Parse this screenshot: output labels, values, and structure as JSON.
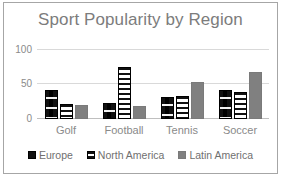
{
  "chart_data": {
    "type": "bar",
    "title": "Sport Popularity by Region",
    "xlabel": "",
    "ylabel": "",
    "categories": [
      "Golf",
      "Football",
      "Tennis",
      "Soccer"
    ],
    "series": [
      {
        "name": "Europe",
        "values": [
          42,
          23,
          32,
          42
        ],
        "color": "#111111",
        "pattern": "dotted-dash"
      },
      {
        "name": "North America",
        "values": [
          22,
          74,
          33,
          38
        ],
        "color": "#ffffff",
        "pattern": "horizontal-stripes"
      },
      {
        "name": "Latin America",
        "values": [
          20,
          19,
          53,
          67
        ],
        "color": "#808080",
        "pattern": "solid"
      }
    ],
    "ylim": [
      0,
      100
    ],
    "yticks": [
      0,
      50,
      100
    ],
    "ytick_labels": [
      "0",
      "50",
      "100"
    ],
    "grid": true,
    "legend_position": "bottom",
    "colors": {
      "title": "#7c7c7c",
      "tick_text": "#8a8a8a",
      "gridline": "#d9d9d9",
      "frame_border": "#a6a6a6"
    }
  }
}
